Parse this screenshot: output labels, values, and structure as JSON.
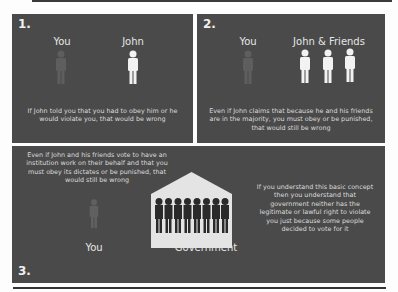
{
  "panels": [
    {
      "number": "1.",
      "left_label": "You",
      "right_label": "John",
      "caption": "If John told you that you had to obey him or he would violate you, that would be wrong"
    },
    {
      "number": "2.",
      "left_label": "You",
      "right_label": "John & Friends",
      "caption": "Even if John claims that because he and his friends are in the majority, you must obey or be punished, that would still be wrong"
    },
    {
      "number": "3.",
      "left_caption": "Even if John and his friends vote to have an institution work on their behalf and that you must obey its dictates or be punished, that would still be wrong",
      "you_label": "You",
      "government_label": "Government",
      "right_caption": "If you understand this basic concept then you understand that government neither has the legitimate or lawful right to violate you just because some people decided to vote for it"
    }
  ],
  "icons": {
    "you_figure": "person-icon-dim",
    "john_figure": "person-icon-white",
    "government_building": "government-building-icon"
  },
  "colors": {
    "panel_bg": "#4a4a4a",
    "text": "#e8e8e8",
    "you_figure": "#5e5e5e",
    "john_figure": "#f2f2f2",
    "building_fill": "#e4e4e4",
    "crowd_fill": "#2a2a2a"
  }
}
